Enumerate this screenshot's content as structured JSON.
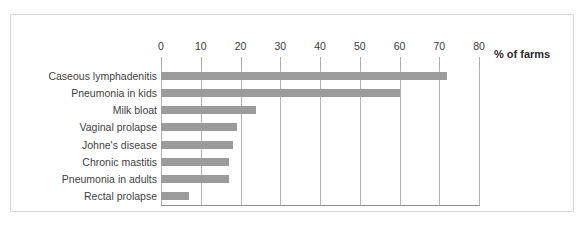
{
  "chart_data": {
    "type": "bar",
    "orientation": "horizontal",
    "title": "",
    "subtitle": "",
    "xlabel": "% of farms",
    "ylabel": "",
    "xlim": [
      0,
      80
    ],
    "xticks": [
      0,
      10,
      20,
      30,
      40,
      50,
      60,
      70,
      80
    ],
    "xtick_labels": [
      "0",
      "10",
      "20",
      "30",
      "40",
      "50",
      "60",
      "70",
      "80"
    ],
    "grid": "vertical",
    "legend": "none",
    "categories": [
      "Caseous lymphadenitis",
      "Pneumonia in kids",
      "Milk bloat",
      "Vaginal prolapse",
      "Johne's disease",
      "Chronic mastitis",
      "Pneumonia in adults",
      "Rectal prolapse"
    ],
    "values": [
      72,
      60,
      24,
      19,
      18,
      17,
      17,
      7
    ],
    "bar_color": "#9b9b9b",
    "gridline_color": "#b4b4b4",
    "axis_color": "#8d8d8d"
  }
}
